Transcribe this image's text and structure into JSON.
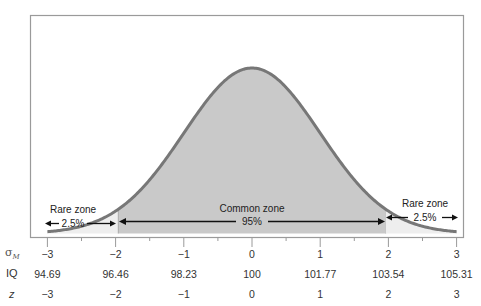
{
  "chart_data": {
    "type": "area",
    "title": "",
    "xlabel": "",
    "ylabel": "",
    "x_rows": [
      {
        "name": "sigma_M",
        "label": "σ",
        "subscript": "M",
        "ticks": [
          "−3",
          "−2",
          "−1",
          "0",
          "1",
          "2",
          "3"
        ]
      },
      {
        "name": "IQ",
        "label": "IQ",
        "ticks": [
          "94.69",
          "96.46",
          "98.23",
          "100",
          "101.77",
          "103.54",
          "105.31"
        ]
      },
      {
        "name": "z",
        "label": "z",
        "ticks": [
          "−3",
          "−2",
          "−1",
          "0",
          "1",
          "2",
          "3"
        ]
      }
    ],
    "x": [
      -3,
      -2,
      -1,
      0,
      1,
      2,
      3
    ],
    "iq_values": [
      94.69,
      96.46,
      98.23,
      100,
      101.77,
      103.54,
      105.31
    ],
    "xlim": [
      -3,
      3
    ],
    "grid": false,
    "zones": [
      {
        "name": "left-rare",
        "label": "Rare zone",
        "percent": "2.5%",
        "from": -3,
        "to": -1.96
      },
      {
        "name": "common",
        "label": "Common zone",
        "percent": "95%",
        "from": -1.96,
        "to": 1.96
      },
      {
        "name": "right-rare",
        "label": "Rare zone",
        "percent": "2.5%",
        "from": 1.96,
        "to": 3
      }
    ],
    "colors": {
      "curve": "#777777",
      "common_fill": "#c9c9c9",
      "rare_fill": "#eeeeee",
      "frame": "#9a9a9a",
      "arrows": "#111111"
    }
  },
  "labels": {
    "left_rare_title": "Rare zone",
    "left_rare_pct": "2.5%",
    "common_title": "Common zone",
    "common_pct": "95%",
    "right_rare_title": "Rare zone",
    "right_rare_pct": "2.5%",
    "row_sigma": "σ",
    "row_sigma_sub": "M",
    "row_iq": "IQ",
    "row_z": "z"
  },
  "ticks": {
    "sigma": [
      "−3",
      "−2",
      "−1",
      "0",
      "1",
      "2",
      "3"
    ],
    "iq": [
      "94.69",
      "96.46",
      "98.23",
      "100",
      "101.77",
      "103.54",
      "105.31"
    ],
    "z": [
      "−3",
      "−2",
      "−1",
      "0",
      "1",
      "2",
      "3"
    ]
  }
}
